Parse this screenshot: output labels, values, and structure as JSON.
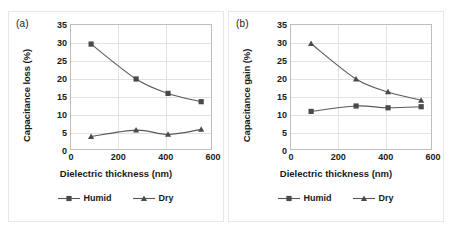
{
  "figure": {
    "panels": [
      {
        "label": "(a)",
        "ytitle": "Capacitance  loss (%)",
        "xtitle": "Dielectric thickness (nm)",
        "legend": [
          {
            "name": "Humid",
            "marker": "square"
          },
          {
            "name": "Dry",
            "marker": "triangle"
          }
        ]
      },
      {
        "label": "(b)",
        "ytitle": "Capacitance  gain (%)",
        "xtitle": "Dielectric thickness (nm)",
        "legend": [
          {
            "name": "Humid",
            "marker": "square"
          },
          {
            "name": "Dry",
            "marker": "triangle"
          }
        ]
      }
    ]
  },
  "style": {
    "line_color": "#595959",
    "marker_color": "#4a4a4a",
    "grid_color": "#e2e2e2",
    "frame_color": "#bdbdbd",
    "text_color": "#1a1a1a"
  },
  "chart_data": [
    {
      "type": "line",
      "title": "(a)",
      "xlabel": "Dielectric thickness (nm)",
      "ylabel": "Capacitance  loss (%)",
      "xlim": [
        0,
        600
      ],
      "ylim": [
        0,
        35
      ],
      "xticks": [
        0,
        200,
        400,
        600
      ],
      "yticks": [
        0,
        5,
        10,
        15,
        20,
        25,
        30,
        35
      ],
      "grid": true,
      "legend_position": "bottom",
      "x": [
        85,
        275,
        410,
        550
      ],
      "series": [
        {
          "name": "Humid",
          "marker": "square",
          "values": [
            29.7,
            20.0,
            16.0,
            13.7
          ]
        },
        {
          "name": "Dry",
          "marker": "triangle",
          "values": [
            4.0,
            5.8,
            4.6,
            6.0
          ]
        }
      ]
    },
    {
      "type": "line",
      "title": "(b)",
      "xlabel": "Dielectric thickness (nm)",
      "ylabel": "Capacitance  gain (%)",
      "xlim": [
        0,
        600
      ],
      "ylim": [
        0,
        35
      ],
      "xticks": [
        0,
        200,
        400,
        600
      ],
      "yticks": [
        0,
        5,
        10,
        15,
        20,
        25,
        30,
        35
      ],
      "grid": true,
      "legend_position": "bottom",
      "x": [
        85,
        275,
        410,
        550
      ],
      "series": [
        {
          "name": "Humid",
          "marker": "square",
          "values": [
            11.0,
            12.5,
            12.0,
            12.3
          ]
        },
        {
          "name": "Dry",
          "marker": "triangle",
          "values": [
            29.8,
            20.0,
            16.4,
            14.1
          ]
        }
      ]
    }
  ]
}
